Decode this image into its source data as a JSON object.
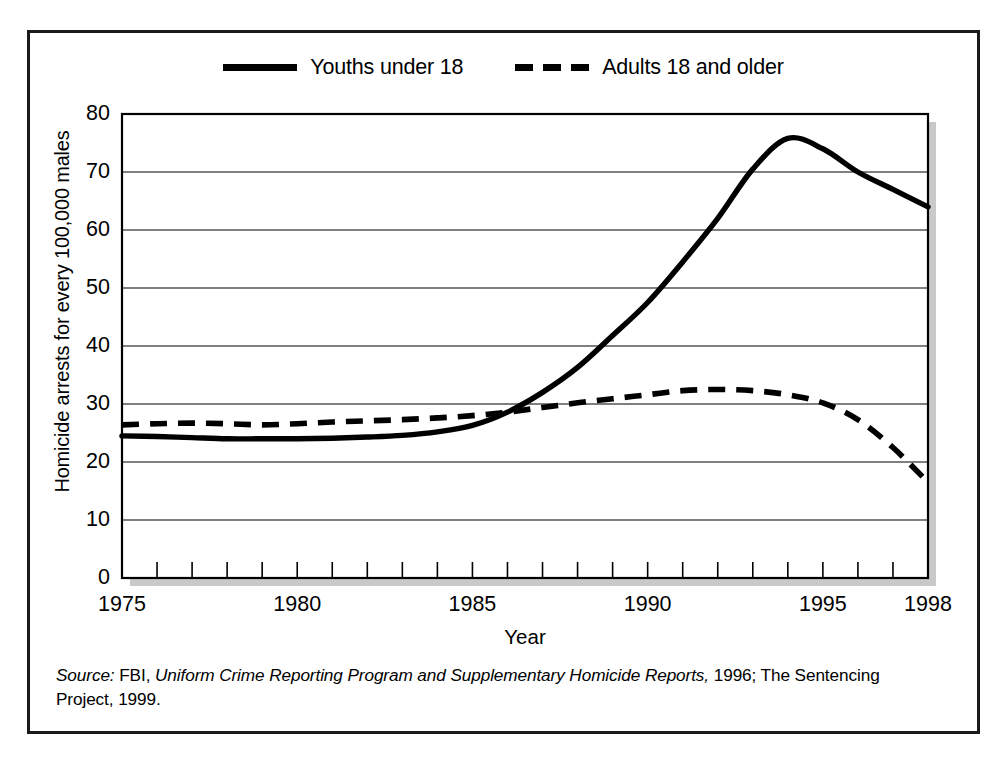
{
  "figure": {
    "ylabel": "Homicide arrests for every 100,000 males",
    "xlabel": "Year",
    "source_prefix": "Source:",
    "source_agency": " FBI, ",
    "source_title": "Uniform Crime Reporting Program and Supplementary Homicide Reports,",
    "source_rest": " 1996; The Sentencing Project, 1999."
  },
  "legend": {
    "items": [
      {
        "label": "Youths under 18",
        "style": "solid",
        "color": "#000000"
      },
      {
        "label": "Adults 18 and older",
        "style": "dashed",
        "color": "#000000"
      }
    ]
  },
  "axes": {
    "y_ticks": [
      "80",
      "70",
      "60",
      "50",
      "40",
      "30",
      "20",
      "10",
      "0"
    ],
    "x_ticks": [
      "1975",
      "1980",
      "1985",
      "1990",
      "1995",
      "1998"
    ]
  },
  "chart_data": {
    "type": "line",
    "title": "",
    "xlabel": "Year",
    "ylabel": "Homicide arrests for every 100,000 males",
    "xlim": [
      1975,
      1998
    ],
    "ylim": [
      0,
      80
    ],
    "grid": true,
    "legend_position": "top-center",
    "x": [
      1975,
      1976,
      1977,
      1978,
      1979,
      1980,
      1981,
      1982,
      1983,
      1984,
      1985,
      1986,
      1987,
      1988,
      1989,
      1990,
      1991,
      1992,
      1993,
      1994,
      1995,
      1996,
      1997,
      1998
    ],
    "series": [
      {
        "name": "Youths under 18",
        "style": "solid",
        "color": "#000000",
        "values": [
          24.5,
          24.4,
          24.2,
          24.0,
          24.0,
          24.0,
          24.1,
          24.3,
          24.6,
          25.2,
          26.3,
          28.6,
          32.0,
          36.3,
          41.8,
          47.5,
          54.5,
          62.0,
          70.5,
          75.8,
          74.0,
          70.0,
          67.0,
          64.0
        ]
      },
      {
        "name": "Adults 18 and older",
        "style": "dashed",
        "color": "#000000",
        "values": [
          26.4,
          26.6,
          26.7,
          26.6,
          26.4,
          26.6,
          26.9,
          27.1,
          27.3,
          27.6,
          28.0,
          28.6,
          29.4,
          30.2,
          30.9,
          31.6,
          32.3,
          32.5,
          32.3,
          31.6,
          30.2,
          27.3,
          22.5,
          16.5
        ]
      }
    ],
    "annotations": [
      {
        "text": "Youth rate peaks at about 76 in 1994",
        "x": 1994,
        "y": 75.8
      },
      {
        "text": "Lines cross near 1986",
        "x": 1986,
        "y": 28.6
      }
    ]
  }
}
